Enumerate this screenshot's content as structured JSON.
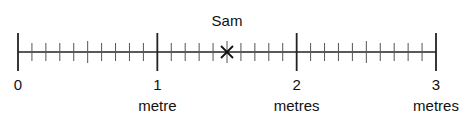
{
  "diagram": {
    "type": "number-line",
    "unit_ticks": [
      {
        "value": 0,
        "label": "0",
        "unit": ""
      },
      {
        "value": 1,
        "label": "1",
        "unit": "metre"
      },
      {
        "value": 2,
        "label": "2",
        "unit": "metres"
      },
      {
        "value": 3,
        "label": "3",
        "unit": "metres"
      }
    ],
    "range": [
      0,
      3
    ],
    "subdivisions_per_unit": 10,
    "marker": {
      "label": "Sam",
      "value": 1.5,
      "symbol": "cross"
    },
    "line_color": "#222222"
  }
}
